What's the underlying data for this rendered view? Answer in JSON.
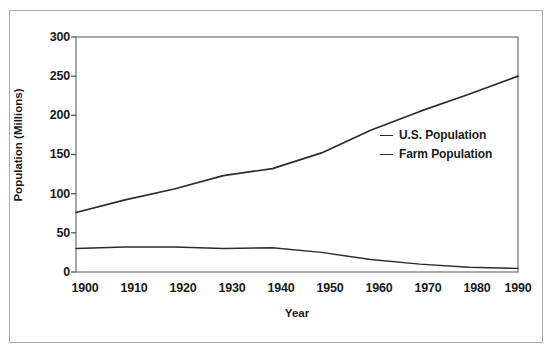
{
  "chart_data": {
    "type": "line",
    "title": "",
    "xlabel": "Year",
    "ylabel": "Population (Millions)",
    "x": [
      1900,
      1910,
      1920,
      1930,
      1940,
      1950,
      1960,
      1970,
      1980,
      1990
    ],
    "xticklabels": [
      "1900",
      "1910",
      "1920",
      "1930",
      "1940",
      "1950",
      "1960",
      "1970",
      "1980",
      "1990"
    ],
    "yticklabels": [
      "0",
      "50",
      "100",
      "150",
      "200",
      "250",
      "300"
    ],
    "yticks": [
      0,
      50,
      100,
      150,
      200,
      250,
      300
    ],
    "xlim": [
      1900,
      1990
    ],
    "ylim": [
      0,
      300
    ],
    "grid": false,
    "legend_position": "center-right",
    "series": [
      {
        "name": "U.S. Population",
        "color": "#2b2b2b",
        "values": [
          76,
          92,
          106,
          123,
          132,
          152,
          181,
          205,
          227,
          250
        ]
      },
      {
        "name": "Farm Population",
        "color": "#2b2b2b",
        "values": [
          30,
          32,
          32,
          30,
          31,
          25,
          16,
          10,
          6,
          4.6
        ]
      }
    ]
  },
  "legend": {
    "items": [
      {
        "label": "U.S. Population"
      },
      {
        "label": "Farm Population"
      }
    ]
  },
  "axes": {
    "x_title": "Year",
    "y_title": "Population (Millions)"
  }
}
